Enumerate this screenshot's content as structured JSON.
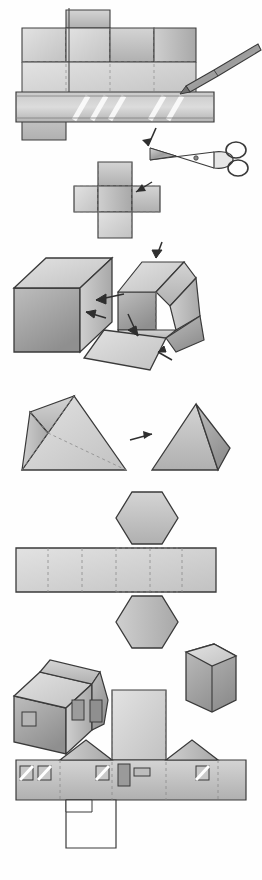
{
  "document": {
    "title": "Paper Model Nets and Folded Solids",
    "medium": "pencil-and-wash illustration",
    "palette": {
      "paper_white": "#fefefe",
      "outline": "#3a3a3a",
      "light_gray": "#d8d8d8",
      "mid_gray": "#bdbdbd",
      "dark_gray": "#9a9a9a",
      "shadow_gray": "#7c7c7c",
      "fold_line": "#8a8a8a"
    }
  },
  "panels": [
    {
      "id": "panel-1",
      "name": "cutting-the-net",
      "caption": "",
      "objects": [
        "cube-net-on-paper",
        "ruler",
        "pencil",
        "scissors",
        "cut-arrow"
      ]
    },
    {
      "id": "panel-2",
      "name": "cube-net-cut-out",
      "caption": "",
      "objects": [
        "cube-net",
        "fold-arrow"
      ]
    },
    {
      "id": "panel-3",
      "name": "folding-the-cube",
      "caption": "",
      "objects": [
        "finished-cube",
        "partly-folded-cube",
        "fold-arrows"
      ]
    },
    {
      "id": "panel-4",
      "name": "tetrahedron-net-and-solid",
      "caption": "",
      "objects": [
        "triangle-net",
        "tetrahedron",
        "fold-arrow"
      ]
    },
    {
      "id": "panel-5",
      "name": "hexagonal-prism-net-and-solid",
      "caption": "",
      "objects": [
        "hexagonal-prism-net",
        "hexagonal-prism"
      ]
    },
    {
      "id": "panel-6",
      "name": "house-model-and-net",
      "caption": "",
      "objects": [
        "paper-house",
        "house-net",
        "windows",
        "door"
      ]
    }
  ],
  "annotations": {
    "arrow_count": 8,
    "dashed_fold_lines": true,
    "labels": []
  }
}
